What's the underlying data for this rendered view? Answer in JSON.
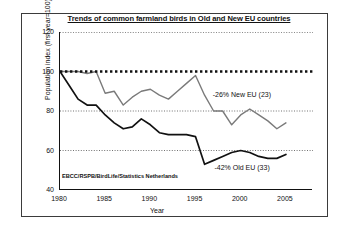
{
  "figure": {
    "title": "Trends of common farmland birds in Old and New EU countries",
    "source_credit": "EBCC/RSPB/BirdLife/Statistics Netherlands",
    "frame_color": "#3b3b3b",
    "background": "#ffffff"
  },
  "annotations": [
    {
      "name": "new-eu-annotation",
      "text": "-26% New EU (23)",
      "x_year": 1999.0,
      "y_value": 88.0
    },
    {
      "name": "old-eu-annotation",
      "text": "-42% Old EU (33)",
      "x_year": 1999.2,
      "y_value": 51.0
    }
  ],
  "chart_data": {
    "type": "line",
    "title": "Trends of common farmland birds in Old and New EU countries",
    "xlabel": "Year",
    "ylabel": "Population index (first year=100)",
    "xlim": [
      1980,
      2008
    ],
    "ylim": [
      40,
      120
    ],
    "xticks": [
      1980,
      1985,
      1990,
      1995,
      2000,
      2005
    ],
    "yticks": [
      40,
      60,
      80,
      100,
      120
    ],
    "grid": "horizontal-dotted",
    "gridlines": [
      60,
      80,
      100,
      120
    ],
    "legend": "inline-annotations",
    "reference_line": {
      "name": "index-100-reference",
      "value": 100,
      "style": "dotted-thick",
      "color": "#111111"
    },
    "series": [
      {
        "name": "New EU (23)",
        "label": "-26% New EU (23)",
        "color": "#7a7a7a",
        "change_percent": -26,
        "countries": 23,
        "x": [
          1980,
          1981,
          1982,
          1983,
          1984,
          1985,
          1986,
          1987,
          1988,
          1989,
          1990,
          1991,
          1992,
          1993,
          1994,
          1995,
          1996,
          1997,
          1998,
          1999,
          2000,
          2001,
          2002,
          2003,
          2004,
          2005
        ],
        "y": [
          100,
          100,
          100,
          99,
          100,
          89,
          90,
          83,
          87,
          90,
          91,
          88,
          86,
          90,
          94,
          98,
          88,
          80,
          80,
          73,
          78,
          81,
          78,
          75,
          71,
          74
        ]
      },
      {
        "name": "Old EU (33)",
        "label": "-42% Old EU (33)",
        "color": "#111111",
        "change_percent": -42,
        "countries": 33,
        "x": [
          1980,
          1981,
          1982,
          1983,
          1984,
          1985,
          1986,
          1987,
          1988,
          1989,
          1990,
          1991,
          1992,
          1993,
          1994,
          1995,
          1996,
          1997,
          1998,
          1999,
          2000,
          2001,
          2002,
          2003,
          2004,
          2005
        ],
        "y": [
          100,
          93,
          86,
          83,
          83,
          78,
          74,
          71,
          72,
          76,
          73,
          69,
          68,
          68,
          68,
          67,
          53,
          55,
          57,
          59,
          60,
          59,
          57,
          56,
          56,
          58
        ]
      }
    ]
  }
}
